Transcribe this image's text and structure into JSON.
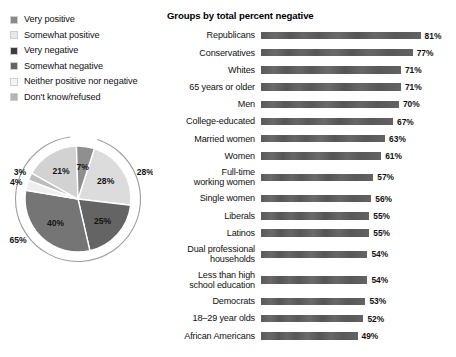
{
  "legend": {
    "items": [
      {
        "label": "Very positive",
        "swatch": "#8a8a8a"
      },
      {
        "label": "Somewhat positive",
        "swatch": "#e8e8e8"
      },
      {
        "label": "Very negative",
        "swatch": "#3c3c3c"
      },
      {
        "label": "Somewhat negative",
        "swatch": "#636363"
      },
      {
        "label": "Neither positive nor negative",
        "swatch": "#f4f4f4"
      },
      {
        "label": "Don't know/refused",
        "swatch": "#b5b5b5"
      }
    ]
  },
  "pie": {
    "slices": [
      {
        "label": "28%",
        "category": "Somewhat positive",
        "value": 28,
        "color": "#dcdcdc"
      },
      {
        "label": "25%",
        "category": "Somewhat negative",
        "value": 25,
        "color": "#646464"
      },
      {
        "label": "40%",
        "category": "Very negative",
        "value": 40,
        "color": "#757575"
      },
      {
        "label": "4%",
        "category": "Neither positive nor negative",
        "value": 4,
        "color": "#efefef"
      },
      {
        "label": "3%",
        "category": "Don't know/refused",
        "value": 3,
        "color": "#bdbdbd"
      },
      {
        "label": "21%",
        "category": "Somewhat positive (inner)",
        "value": 21,
        "color": "#d2d2d2"
      },
      {
        "label": "7%",
        "category": "Very positive",
        "value": 7,
        "color": "#8f8f8f"
      }
    ],
    "ring_labels": [
      {
        "label": "28%",
        "meaning": "total percent positive"
      },
      {
        "label": "65%",
        "meaning": "total percent negative"
      }
    ]
  },
  "chart_data": {
    "type": "bar",
    "title": "Groups by total percent negative",
    "xlabel": "",
    "ylabel": "",
    "xlim": [
      0,
      100
    ],
    "grid": false,
    "orientation": "horizontal",
    "categories": [
      "Republicans",
      "Conservatives",
      "Whites",
      "65 years or older",
      "Men",
      "College-educated",
      "Married women",
      "Women",
      "Full-time\nworking women",
      "Single women",
      "Liberals",
      "Latinos",
      "Dual professional\nhouseholds",
      "Less than high\nschool education",
      "Democrats",
      "18–29 year olds",
      "African Americans"
    ],
    "values": [
      81,
      77,
      71,
      71,
      70,
      67,
      63,
      61,
      57,
      56,
      55,
      55,
      54,
      54,
      53,
      52,
      49
    ],
    "value_labels": [
      "81%",
      "77%",
      "71%",
      "71%",
      "70%",
      "67%",
      "63%",
      "61%",
      "57%",
      "56%",
      "55%",
      "55%",
      "54%",
      "54%",
      "53%",
      "52%",
      "49%"
    ],
    "two_line_rows": [
      8,
      12,
      13
    ],
    "bar_color": "#5d5d5d"
  }
}
